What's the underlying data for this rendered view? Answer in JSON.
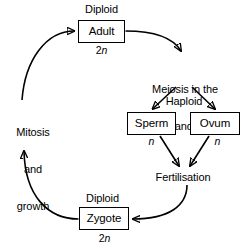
{
  "diagram": {
    "background_color": "#ffffff",
    "stroke_color": "#000000",
    "nodes": [
      {
        "id": "adult",
        "label": "Adult",
        "ploidy": "2n"
      },
      {
        "id": "sperm",
        "label": "Sperm",
        "ploidy": "n"
      },
      {
        "id": "ovum",
        "label": "Ovum",
        "ploidy": "n"
      },
      {
        "id": "zygote",
        "label": "Zygote",
        "ploidy": "2n"
      }
    ],
    "labels": {
      "diploid_top": "Diploid",
      "diploid_bottom": "Diploid",
      "haploid": "Haploid",
      "meiosis_line1": "Meiosis in the",
      "meiosis_line2": "ovary and testes",
      "fertilisation": "Fertilisation",
      "mitosis_line1": "Mitosis",
      "mitosis_line2": "and",
      "mitosis_line3": "growth"
    },
    "ploidy": {
      "adult_prefix": "2",
      "adult_italic": "n",
      "sperm_prefix": "",
      "sperm_italic": "n",
      "ovum_prefix": "",
      "ovum_italic": "n",
      "zygote_prefix": "2",
      "zygote_italic": "n"
    },
    "edges": [
      {
        "id": "adult-to-meiosis",
        "from": "adult",
        "to": "meiosis",
        "style": "curved"
      },
      {
        "id": "meiosis-to-sperm",
        "from": "meiosis",
        "to": "sperm",
        "style": "straight"
      },
      {
        "id": "meiosis-to-ovum",
        "from": "meiosis",
        "to": "ovum",
        "style": "straight"
      },
      {
        "id": "sperm-to-fertilisation",
        "from": "sperm",
        "to": "fertilisation",
        "style": "straight"
      },
      {
        "id": "ovum-to-fertilisation",
        "from": "ovum",
        "to": "fertilisation",
        "style": "straight"
      },
      {
        "id": "fertilisation-to-zygote",
        "from": "fertilisation",
        "to": "zygote",
        "style": "curved"
      },
      {
        "id": "zygote-to-mitosis",
        "from": "zygote",
        "to": "mitosis",
        "style": "curved"
      },
      {
        "id": "mitosis-to-adult",
        "from": "mitosis",
        "to": "adult",
        "style": "curved"
      }
    ]
  }
}
